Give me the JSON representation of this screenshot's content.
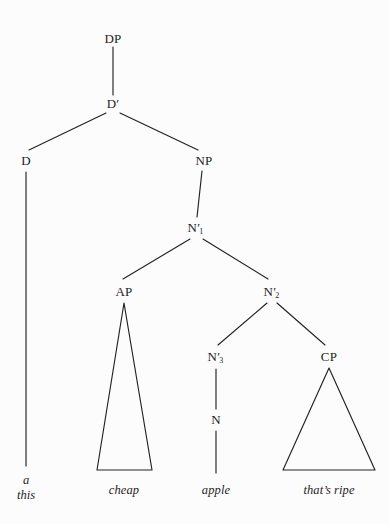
{
  "diagram": {
    "kind": "syntax-tree",
    "title": "",
    "background_color": "#fcfcfc",
    "line_color": "#222222",
    "text_color": "#1c1c1c"
  },
  "nodes": {
    "dp": {
      "label": "DP",
      "x": 113,
      "y": 39
    },
    "dbar": {
      "label": "D",
      "prime": "′",
      "x": 113,
      "y": 104
    },
    "d": {
      "label": "D",
      "x": 26,
      "y": 161
    },
    "np": {
      "label": "NP",
      "x": 204,
      "y": 161
    },
    "nbar1": {
      "label": "N",
      "prime": "′",
      "sub": "1",
      "x": 196,
      "y": 228
    },
    "ap": {
      "label": "AP",
      "x": 124,
      "y": 292
    },
    "nbar2": {
      "label": "N",
      "prime": "′",
      "sub": "2",
      "x": 272,
      "y": 292
    },
    "nbar3": {
      "label": "N",
      "prime": "′",
      "sub": "3",
      "x": 216,
      "y": 357
    },
    "cp": {
      "label": "CP",
      "x": 329,
      "y": 357
    },
    "n": {
      "label": "N",
      "x": 216,
      "y": 420
    }
  },
  "leaves": {
    "d_words": {
      "lines": [
        "a",
        "this"
      ],
      "x": 26,
      "y": 483
    },
    "cheap": {
      "text": "cheap",
      "x": 124,
      "y": 490
    },
    "apple": {
      "text": "apple",
      "x": 216,
      "y": 490
    },
    "thats_ripe": {
      "text": "that’s ripe",
      "x": 329,
      "y": 490
    }
  },
  "edges": [
    {
      "name": "dp-to-dbar",
      "x1": 113,
      "y1": 47,
      "x2": 113,
      "y2": 95
    },
    {
      "name": "dbar-to-d",
      "x1": 106,
      "y1": 113,
      "x2": 29,
      "y2": 150
    },
    {
      "name": "dbar-to-np",
      "x1": 120,
      "y1": 113,
      "x2": 198,
      "y2": 150
    },
    {
      "name": "d-to-leaf",
      "x1": 26,
      "y1": 172,
      "x2": 26,
      "y2": 466
    },
    {
      "name": "np-to-nbar1",
      "x1": 202,
      "y1": 171,
      "x2": 197,
      "y2": 217
    },
    {
      "name": "nbar1-to-ap",
      "x1": 190,
      "y1": 239,
      "x2": 123,
      "y2": 279
    },
    {
      "name": "nbar1-to-nbar2",
      "x1": 203,
      "y1": 239,
      "x2": 268,
      "y2": 279
    },
    {
      "name": "nbar2-to-nbar3",
      "x1": 267,
      "y1": 303,
      "x2": 218,
      "y2": 345
    },
    {
      "name": "nbar2-to-cp",
      "x1": 277,
      "y1": 303,
      "x2": 325,
      "y2": 345
    },
    {
      "name": "nbar3-to-n",
      "x1": 216,
      "y1": 369,
      "x2": 216,
      "y2": 409
    },
    {
      "name": "n-to-leaf",
      "x1": 216,
      "y1": 431,
      "x2": 216,
      "y2": 473
    }
  ],
  "triangles": [
    {
      "name": "ap-triangle",
      "apex_x": 124,
      "apex_y": 303,
      "base_left_x": 97,
      "base_right_x": 152,
      "base_y": 470
    },
    {
      "name": "cp-triangle",
      "apex_x": 329,
      "apex_y": 368,
      "base_left_x": 283,
      "base_right_x": 375,
      "base_y": 470
    }
  ]
}
